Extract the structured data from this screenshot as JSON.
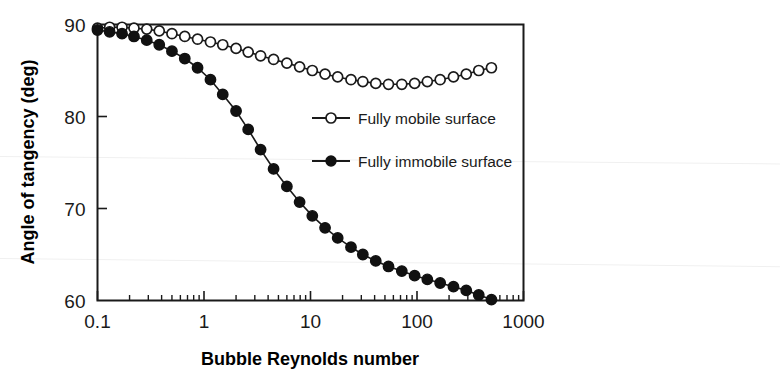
{
  "chart_data": {
    "type": "line",
    "title": "",
    "xlabel": "Bubble Reynolds number",
    "ylabel": "Angle of tangency (deg)",
    "xscale": "log",
    "xlim": [
      0.1,
      1000
    ],
    "ylim": [
      60,
      90
    ],
    "xticks": [
      0.1,
      1,
      10,
      100,
      1000
    ],
    "xticklabels": [
      "0.1",
      "1",
      "10",
      "100",
      "1000"
    ],
    "yticks": [
      60,
      70,
      80,
      90
    ],
    "yticklabels": [
      "60",
      "70",
      "80",
      "90"
    ],
    "grid": false,
    "legend_position": "center-right-inside",
    "series": [
      {
        "name": "Fully mobile surface",
        "marker": "open-circle",
        "color": "#1a1a1a",
        "x": [
          0.1,
          0.13,
          0.17,
          0.22,
          0.29,
          0.38,
          0.5,
          0.66,
          0.87,
          1.15,
          1.5,
          2.0,
          2.6,
          3.4,
          4.5,
          6.0,
          7.9,
          10.4,
          13.7,
          18.0,
          24.0,
          31.0,
          41.0,
          54.0,
          72.0,
          95.0,
          125.0,
          165.0,
          220.0,
          290.0,
          380.0,
          500.0
        ],
        "y": [
          89.6,
          89.7,
          89.7,
          89.6,
          89.5,
          89.3,
          89.0,
          88.7,
          88.4,
          88.1,
          87.8,
          87.4,
          87.0,
          86.6,
          86.2,
          85.8,
          85.4,
          85.0,
          84.6,
          84.3,
          84.0,
          83.8,
          83.6,
          83.5,
          83.5,
          83.6,
          83.8,
          84.0,
          84.3,
          84.6,
          85.0,
          85.3
        ]
      },
      {
        "name": "Fully immobile surface",
        "marker": "filled-circle",
        "color": "#111111",
        "x": [
          0.1,
          0.13,
          0.17,
          0.22,
          0.29,
          0.38,
          0.5,
          0.66,
          0.87,
          1.15,
          1.5,
          2.0,
          2.6,
          3.4,
          4.5,
          6.0,
          7.9,
          10.4,
          13.7,
          18.0,
          24.0,
          31.0,
          41.0,
          54.0,
          72.0,
          95.0,
          125.0,
          165.0,
          220.0,
          290.0,
          380.0,
          500.0
        ],
        "y": [
          89.4,
          89.2,
          89.0,
          88.7,
          88.3,
          87.8,
          87.1,
          86.3,
          85.3,
          84.0,
          82.4,
          80.6,
          78.6,
          76.4,
          74.3,
          72.4,
          70.7,
          69.2,
          67.9,
          66.8,
          65.8,
          65.0,
          64.3,
          63.7,
          63.2,
          62.7,
          62.3,
          61.9,
          61.5,
          61.1,
          60.6,
          60.1
        ]
      }
    ]
  },
  "legend": {
    "entries": [
      {
        "label": "Fully mobile surface",
        "marker": "open-circle"
      },
      {
        "label": "Fully immobile surface",
        "marker": "filled-circle"
      }
    ]
  },
  "axes": {
    "x_title": "Bubble Reynolds number",
    "y_title": "Angle of tangency (deg)",
    "x_tick_labels": [
      "0.1",
      "1",
      "10",
      "100",
      "1000"
    ],
    "y_tick_labels": [
      "90",
      "80",
      "70",
      "60"
    ]
  }
}
